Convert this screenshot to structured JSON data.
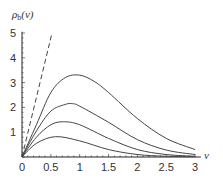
{
  "chart_data": {
    "type": "line",
    "title": "",
    "xlabel": "ν",
    "ylabel": "ρ_b(ν)",
    "ylabel_display": "ρb(ν)",
    "xlim": [
      0,
      3.1
    ],
    "ylim": [
      0,
      5
    ],
    "x_ticks": [
      "0",
      "0.5",
      "1",
      "1.5",
      "2",
      "2.5",
      "3"
    ],
    "y_ticks": [
      "1",
      "2",
      "3",
      "4",
      "5"
    ],
    "grid": false,
    "legend": null,
    "series": [
      {
        "name": "dashed-line",
        "style": "dashed",
        "x": [
          0,
          0.52
        ],
        "y": [
          0,
          5
        ]
      },
      {
        "name": "curve-1",
        "style": "solid",
        "x": [
          0,
          0.25,
          0.5,
          0.75,
          1.0,
          1.25,
          1.5,
          2.0,
          2.5,
          3.0
        ],
        "y": [
          0,
          1.3,
          2.6,
          3.2,
          3.3,
          3.05,
          2.6,
          1.55,
          0.75,
          0.3
        ]
      },
      {
        "name": "curve-2",
        "style": "solid",
        "x": [
          0,
          0.25,
          0.5,
          0.75,
          0.87,
          1.0,
          1.5,
          2.0,
          2.5,
          3.0
        ],
        "y": [
          0,
          1.05,
          1.85,
          2.12,
          2.15,
          2.05,
          1.4,
          0.7,
          0.28,
          0.1
        ]
      },
      {
        "name": "curve-3",
        "style": "solid",
        "x": [
          0,
          0.25,
          0.5,
          0.72,
          1.0,
          1.5,
          2.0,
          2.5,
          3.0
        ],
        "y": [
          0,
          0.8,
          1.3,
          1.42,
          1.3,
          0.75,
          0.3,
          0.1,
          0.03
        ]
      },
      {
        "name": "curve-4",
        "style": "solid",
        "x": [
          0,
          0.25,
          0.58,
          1.0,
          1.5,
          2.0,
          2.5,
          3.0
        ],
        "y": [
          0,
          0.55,
          0.82,
          0.65,
          0.3,
          0.1,
          0.03,
          0.01
        ]
      }
    ]
  }
}
